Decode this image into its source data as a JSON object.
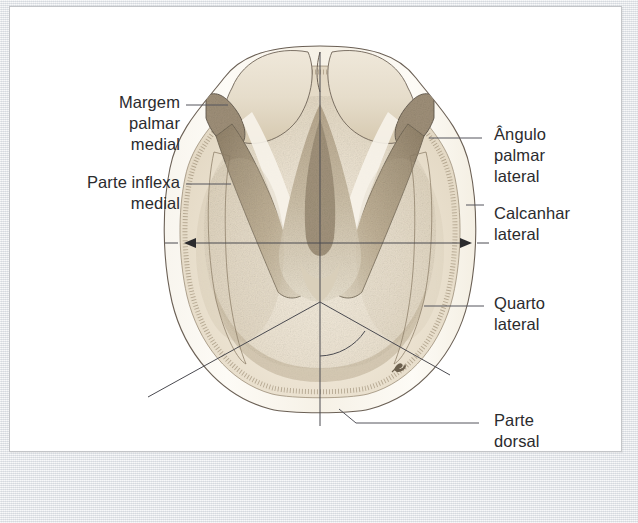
{
  "figure": {
    "kind": "anatomical-illustration",
    "language": "pt-BR",
    "page_bg": "#ffffff",
    "scan_bg": "#e4e7ea",
    "ink_color": "#2b2b2e",
    "leader_color": "#4a4a50",
    "outline_color": "#5a5148",
    "hoof_palette": {
      "cream": "#f6f1e7",
      "pale": "#eee7d9",
      "tan": "#d8cbb4",
      "taupe": "#b8a98f",
      "shadow": "#8d7f69",
      "wall_line": "#7a6d5c"
    }
  },
  "labels": {
    "left": [
      {
        "id": "margem-palmar-medial",
        "text": "Margem\npalmar\nmedial",
        "x": 60,
        "y": 92,
        "width": 120,
        "align": "right"
      },
      {
        "id": "parte-inflexa-medial",
        "text": "Parte inflexa\nmedial",
        "x": 28,
        "y": 172,
        "width": 152,
        "align": "right"
      }
    ],
    "right": [
      {
        "id": "angulo-palmar-lateral",
        "text": "Ângulo\npalmar\nlateral",
        "x": 494,
        "y": 124,
        "width": 130,
        "align": "left"
      },
      {
        "id": "calcanhar-lateral",
        "text": "Calcanhar\nlateral",
        "x": 494,
        "y": 203,
        "width": 130,
        "align": "left"
      },
      {
        "id": "quarto-lateral",
        "text": "Quarto\nlateral",
        "x": 494,
        "y": 293,
        "width": 130,
        "align": "left"
      },
      {
        "id": "parte-dorsal",
        "text": "Parte\ndorsal",
        "x": 494,
        "y": 410,
        "width": 130,
        "align": "left"
      }
    ]
  },
  "leaders": [
    {
      "id": "leader-margem-palmar-medial",
      "points": "186,105 228,105"
    },
    {
      "id": "leader-parte-inflexa-medial",
      "points": "186,184 231,184"
    },
    {
      "id": "leader-angulo-palmar-lateral",
      "points": "429,138 482,138"
    },
    {
      "id": "leader-calcanhar-lateral",
      "points": "466,205 484,205"
    },
    {
      "id": "leader-quarto-lateral",
      "points": "424,306 484,306"
    },
    {
      "id": "leader-parte-dorsal",
      "points": "339,409 356,423 479,423"
    }
  ],
  "measure_arrow": {
    "id": "hoof-width-arrow",
    "y": 243,
    "x1": 185,
    "x2": 470,
    "tick_left": "165,243 183,243",
    "tick_right": "472,243 487,243"
  },
  "axes": {
    "midline": {
      "id": "vertical-midline",
      "x": 320,
      "y1": 52,
      "y2": 426
    },
    "diagonal_left": {
      "id": "diagonal-left",
      "points": "320,302 148,397"
    },
    "diagonal_right": {
      "id": "diagonal-right",
      "points": "320,302 400,347 450,375"
    },
    "angle_arc": {
      "id": "angle-arc",
      "path": "M 320 355 A 54 54 0 0 0 363 330"
    }
  },
  "signature": {
    "id": "artist-signature",
    "x": 397,
    "y": 368
  }
}
